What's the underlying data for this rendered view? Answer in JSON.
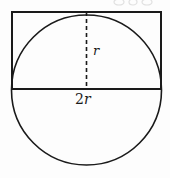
{
  "figure": {
    "background_color": "#fdfdfd",
    "stroke_color": "#1a1a1a",
    "labels": {
      "radius": "r",
      "diameter_prefix": "2",
      "diameter_symbol": "r"
    },
    "shapes": {
      "circle": {
        "name": "circle",
        "center_x": 86.5,
        "center_y": 90,
        "radius": 75,
        "stroke_width": 1.6,
        "fill": "none"
      },
      "rectangle": {
        "name": "bounding-rectangle",
        "x": 12,
        "y": 12,
        "width": 149,
        "height": 77,
        "stroke_width": 1.8,
        "fill": "none"
      },
      "radius_line": {
        "name": "dashed-radius-line",
        "x": 86.5,
        "y1": 12,
        "y2": 89,
        "stroke_width": 1.6,
        "dash_pattern": "4,3"
      }
    }
  }
}
